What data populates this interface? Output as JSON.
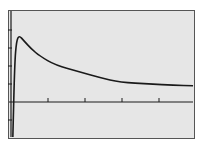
{
  "chart_data": {
    "type": "line",
    "title": "",
    "xlabel": "",
    "ylabel": "",
    "grid": false,
    "legend": null,
    "x_ticks": [
      1,
      2,
      3,
      4
    ],
    "y_ticks": [
      -1,
      1,
      2,
      3,
      4
    ],
    "xlim": [
      -0.1,
      4.9
    ],
    "ylim": [
      -2.0,
      5.1
    ],
    "series": [
      {
        "name": "f(x)",
        "x": [
          0.05,
          0.1,
          0.15,
          0.22,
          0.35,
          0.55,
          0.78,
          1.2,
          1.86,
          2.4,
          2.95,
          3.76,
          4.4,
          4.92
        ],
        "y": [
          -2.0,
          2.2,
          3.4,
          3.7,
          3.4,
          2.95,
          2.55,
          2.05,
          1.67,
          1.35,
          1.1,
          1.0,
          0.93,
          0.9
        ]
      }
    ],
    "colors": {
      "screen_bg": "#e6e6e6",
      "curve": "#1a1a1a",
      "axes": "#1a1a1a",
      "frame": "#555555"
    }
  }
}
